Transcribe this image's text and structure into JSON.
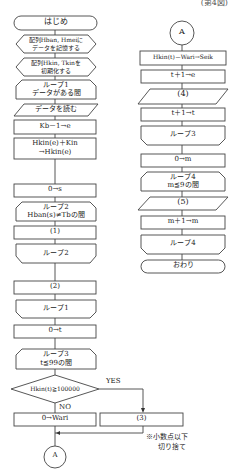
{
  "figure": {
    "caption": "(第4図)",
    "left_column": {
      "start": "はじめ",
      "prep1": [
        "配列Hban, Hmeiに",
        "データを記憶する"
      ],
      "prep2": [
        "配列Hkin, Tkinを",
        "初期化する"
      ],
      "loop1_start": [
        "ループ1",
        "データがある間"
      ],
      "read_data": "データを読む",
      "proc_kb": "Kb－1→e",
      "proc_hkin": [
        "Hkin(e)＋Kin",
        "→Hkin(e)"
      ],
      "proc_s": "0→s",
      "loop2_start": [
        "ループ2",
        "Hban(s)≠Tbの間"
      ],
      "blank1": "(1)",
      "loop2_end": "ループ2",
      "blank2": "(2)",
      "loop1_end": "ループ1",
      "proc_t": "0→t",
      "loop3_start": [
        "ループ3",
        "t≦99の間"
      ],
      "decision": "Hkin(t)≧100000",
      "yes_label": "YES",
      "no_label": "NO",
      "proc_wari": "0→Wari",
      "blank3": "(3)",
      "note": [
        "※小数点以下",
        "切り捨て"
      ],
      "connector": "A"
    },
    "right_column": {
      "connector": "A",
      "proc_seik": "Hkin(t)－Wari→Seik",
      "proc_e": "t＋1→e",
      "blank4": "(4)",
      "proc_t": "t＋1→t",
      "loop3_end": "ループ3",
      "proc_m": "0→m",
      "loop4_start": [
        "ループ4",
        "m≦9の間"
      ],
      "blank5": "(5)",
      "proc_m_inc": "m＋1→m",
      "loop4_end": "ループ4",
      "end": "おわり"
    }
  }
}
